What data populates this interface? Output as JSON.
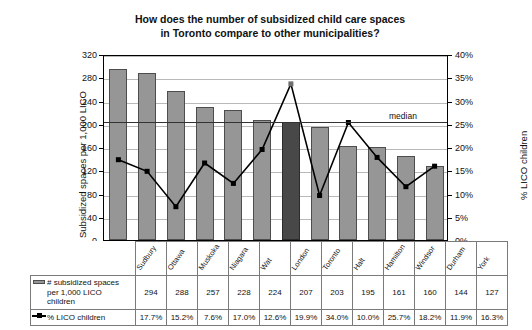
{
  "chart_data": {
    "type": "bar",
    "title": "How does the number of subsidized child care spaces in Toronto compare to other municipalities?",
    "title_line1": "How does the number of subsidized child care spaces",
    "title_line2": "in Toronto compare to other municipalities?",
    "categories": [
      "Sudbury",
      "Ottawa",
      "Muskoka",
      "Niagara",
      "Wat",
      "London",
      "Toronto",
      "Halt",
      "Hamilton",
      "Windsor",
      "Durham",
      "York"
    ],
    "series": [
      {
        "name": "# subsidized spaces per 1,000 LICO children",
        "type": "bar",
        "values": [
          294,
          288,
          257,
          228,
          224,
          207,
          203,
          195,
          161,
          160,
          144,
          127
        ],
        "axis": "left",
        "color": "#969696",
        "highlight_index": 6,
        "highlight_color": "#484848"
      },
      {
        "name": "% LICO children",
        "type": "line",
        "values": [
          17.7,
          15.2,
          7.6,
          17.0,
          12.6,
          19.9,
          34.0,
          10.0,
          25.7,
          18.2,
          11.9,
          16.3
        ],
        "labels": [
          "17.7%",
          "15.2%",
          "7.6%",
          "17.0%",
          "12.6%",
          "19.9%",
          "34.0%",
          "10.0%",
          "25.7%",
          "18.2%",
          "11.9%",
          "16.3%"
        ],
        "axis": "right",
        "color": "#000000"
      }
    ],
    "ylabel": "Subsidized spaces per 1,000 LICO",
    "ylabel_right": "% LICO children",
    "xlabel": "",
    "ylim": [
      0,
      320
    ],
    "yticks": [
      0,
      40,
      80,
      120,
      160,
      200,
      240,
      280,
      320
    ],
    "ytick_labels": [
      "0",
      "40",
      "80",
      "120",
      "160",
      "200",
      "240",
      "280",
      "320"
    ],
    "ylim_right": [
      0,
      40
    ],
    "yticks_right": [
      0,
      5,
      10,
      15,
      20,
      25,
      30,
      35,
      40
    ],
    "ytick_labels_right": [
      "0%",
      "5%",
      "10%",
      "15%",
      "20%",
      "25%",
      "30%",
      "35%",
      "40%"
    ],
    "grid": true,
    "legend_position": "bottom-table",
    "annotations": [
      {
        "text": "median",
        "value": 207,
        "axis": "left"
      }
    ]
  },
  "table": {
    "row1_label_line1": "# subsidized spaces",
    "row1_label_line2": "per 1,000 LICO",
    "row1_label_line3": "children",
    "row2_label": "% LICO children",
    "row1_values": [
      "294",
      "288",
      "257",
      "228",
      "224",
      "207",
      "203",
      "195",
      "161",
      "160",
      "144",
      "127"
    ],
    "row2_values": [
      "17.7%",
      "15.2%",
      "7.6%",
      "17.0%",
      "12.6%",
      "19.9%",
      "34.0%",
      "10.0%",
      "25.7%",
      "18.2%",
      "11.9%",
      "16.3%"
    ],
    "categories": [
      "Sudbury",
      "Ottawa",
      "Muskoka",
      "Niagara",
      "Wat",
      "London",
      "Toronto",
      "Halt",
      "Hamilton",
      "Windsor",
      "Durham",
      "York"
    ]
  }
}
